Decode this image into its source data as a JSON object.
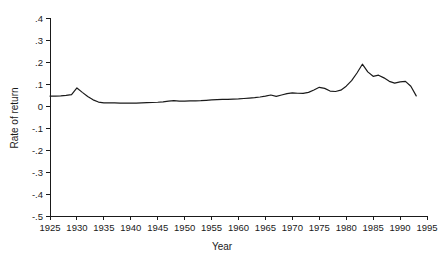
{
  "chart_data": {
    "type": "line",
    "title": "",
    "xlabel": "Year",
    "ylabel": "Rate of return",
    "xlim": [
      1925,
      1995
    ],
    "ylim": [
      -0.5,
      0.4
    ],
    "grid": false,
    "legend": null,
    "xticks": [
      1925,
      1930,
      1935,
      1940,
      1945,
      1950,
      1955,
      1960,
      1965,
      1970,
      1975,
      1980,
      1985,
      1990,
      1995
    ],
    "xtick_labels": [
      "1925",
      "1930",
      "1935",
      "1940",
      "1945",
      "1950",
      "1955",
      "1960",
      "1965",
      "1970",
      "1975",
      "1980",
      "1985",
      "1990",
      "1995"
    ],
    "yticks": [
      0.4,
      0.3,
      0.2,
      0.1,
      0.0,
      -0.1,
      -0.2,
      -0.3,
      -0.4,
      -0.5
    ],
    "ytick_labels": [
      ".4",
      ".3",
      ".2",
      ".1",
      "0",
      "-.1",
      "-.2",
      "-.3",
      "-.4",
      "-.5"
    ],
    "series": [
      {
        "name": "Rate of return",
        "x": [
          1925,
          1926,
          1927,
          1928,
          1929,
          1930,
          1931,
          1932,
          1933,
          1934,
          1935,
          1936,
          1937,
          1938,
          1939,
          1940,
          1941,
          1942,
          1943,
          1944,
          1945,
          1946,
          1947,
          1948,
          1949,
          1950,
          1951,
          1952,
          1953,
          1954,
          1955,
          1956,
          1957,
          1958,
          1959,
          1960,
          1961,
          1962,
          1963,
          1964,
          1965,
          1966,
          1967,
          1968,
          1969,
          1970,
          1971,
          1972,
          1973,
          1974,
          1975,
          1976,
          1977,
          1978,
          1979,
          1980,
          1981,
          1982,
          1983,
          1984,
          1985,
          1986,
          1987,
          1988,
          1989,
          1990,
          1991,
          1992,
          1993
        ],
        "y": [
          0.045,
          0.045,
          0.046,
          0.048,
          0.052,
          0.082,
          0.062,
          0.043,
          0.028,
          0.018,
          0.014,
          0.014,
          0.014,
          0.013,
          0.013,
          0.013,
          0.013,
          0.014,
          0.015,
          0.016,
          0.017,
          0.019,
          0.022,
          0.024,
          0.022,
          0.022,
          0.023,
          0.023,
          0.024,
          0.026,
          0.028,
          0.029,
          0.03,
          0.03,
          0.031,
          0.032,
          0.034,
          0.036,
          0.038,
          0.041,
          0.045,
          0.05,
          0.044,
          0.05,
          0.056,
          0.06,
          0.058,
          0.057,
          0.062,
          0.073,
          0.085,
          0.08,
          0.068,
          0.066,
          0.072,
          0.09,
          0.115,
          0.15,
          0.19,
          0.155,
          0.135,
          0.14,
          0.128,
          0.112,
          0.104,
          0.11,
          0.112,
          0.09,
          0.046
        ]
      }
    ]
  }
}
